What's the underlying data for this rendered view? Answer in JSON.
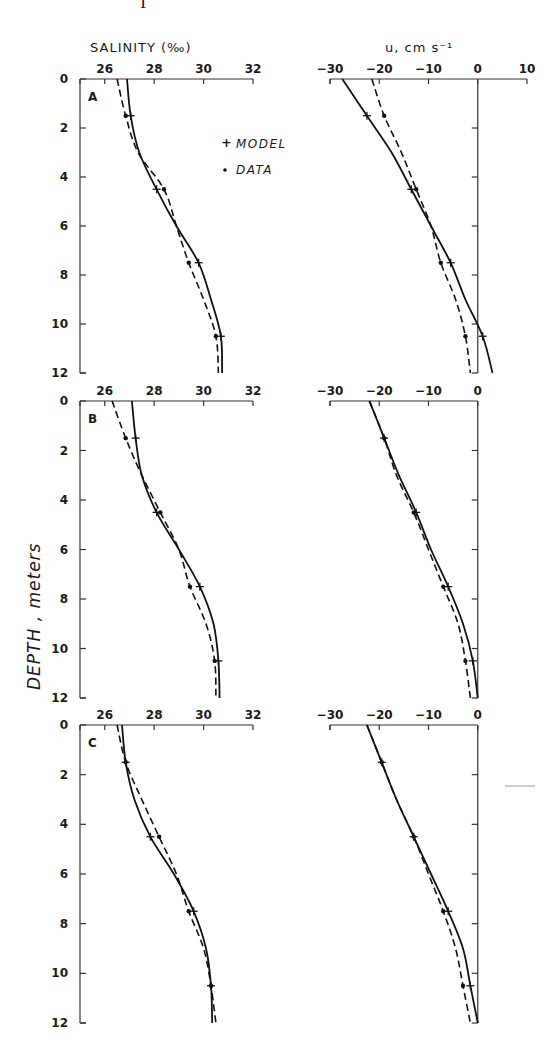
{
  "figure": {
    "top_fragment": "I",
    "y_axis_title": "DEPTH , meters",
    "left_column_title": "SALINITY (‰)",
    "right_column_title": "u, cm s⁻¹",
    "legend": {
      "model_label": "MODEL",
      "data_label": "DATA",
      "model_marker": "+",
      "data_marker": "•"
    }
  },
  "chart_data": [
    {
      "panel": "A",
      "type": "line",
      "title": "SALINITY (‰)",
      "xlabel": "SALINITY (‰)",
      "ylabel": "DEPTH , meters",
      "x_ticks": [
        26,
        28,
        30,
        32
      ],
      "y_ticks": [
        0,
        2,
        4,
        6,
        8,
        10,
        12
      ],
      "xlim": [
        25,
        32
      ],
      "ylim": [
        12,
        0
      ],
      "depth": [
        0,
        1.5,
        3,
        4.5,
        6,
        7.5,
        9,
        10.5,
        12
      ],
      "markers_at_depth": [
        1.5,
        4.5,
        7.5,
        10.5
      ],
      "series": [
        {
          "name": "MODEL",
          "style": "solid",
          "marker": "+",
          "values": [
            26.9,
            27.05,
            27.4,
            28.1,
            28.9,
            29.8,
            30.3,
            30.7,
            30.75
          ]
        },
        {
          "name": "DATA",
          "style": "dashed",
          "marker": "dot",
          "values": [
            26.5,
            26.85,
            27.35,
            28.4,
            28.9,
            29.4,
            30.0,
            30.5,
            30.6
          ]
        }
      ]
    },
    {
      "panel": "A",
      "type": "line",
      "title": "u, cm s⁻¹",
      "xlabel": "u, cm s⁻¹",
      "ylabel": "DEPTH , meters",
      "x_ticks": [
        -30,
        -20,
        -10,
        0,
        10
      ],
      "y_ticks": [
        0,
        2,
        4,
        6,
        8,
        10,
        12
      ],
      "xlim": [
        -30,
        10
      ],
      "ylim": [
        12,
        0
      ],
      "depth": [
        0,
        1.5,
        3,
        4.5,
        6,
        7.5,
        9,
        10.5,
        12
      ],
      "markers_at_depth": [
        1.5,
        4.5,
        7.5,
        10.5
      ],
      "series": [
        {
          "name": "MODEL",
          "style": "solid",
          "marker": "+",
          "values": [
            -27.5,
            -22.5,
            -17.5,
            -13.5,
            -9.5,
            -5.5,
            -2.5,
            1,
            3
          ]
        },
        {
          "name": "DATA",
          "style": "dashed",
          "marker": "dot",
          "values": [
            -21.5,
            -19,
            -15.5,
            -12.5,
            -9.5,
            -7.5,
            -4.5,
            -2.5,
            -1.5
          ]
        }
      ]
    },
    {
      "panel": "B",
      "type": "line",
      "title": "SALINITY (‰)",
      "xlabel": "SALINITY (‰)",
      "ylabel": "DEPTH , meters",
      "x_ticks": [
        26,
        28,
        30,
        32
      ],
      "y_ticks": [
        0,
        2,
        4,
        6,
        8,
        10,
        12
      ],
      "xlim": [
        25,
        32
      ],
      "ylim": [
        12,
        0
      ],
      "depth": [
        0,
        1.5,
        3,
        4.5,
        6,
        7.5,
        9,
        10.5,
        12
      ],
      "markers_at_depth": [
        1.5,
        4.5,
        7.5,
        10.5
      ],
      "series": [
        {
          "name": "MODEL",
          "style": "solid",
          "marker": "+",
          "values": [
            27.1,
            27.25,
            27.5,
            28.1,
            29.0,
            29.85,
            30.4,
            30.6,
            30.65
          ]
        },
        {
          "name": "DATA",
          "style": "dashed",
          "marker": "dot",
          "values": [
            26.3,
            26.85,
            27.5,
            28.25,
            29.0,
            29.45,
            30.1,
            30.45,
            30.5
          ]
        }
      ]
    },
    {
      "panel": "B",
      "type": "line",
      "title": "u, cm s⁻¹",
      "xlabel": "u, cm s⁻¹",
      "ylabel": "DEPTH , meters",
      "x_ticks": [
        -30,
        -20,
        -10,
        0
      ],
      "y_ticks": [
        0,
        2,
        4,
        6,
        8,
        10,
        12
      ],
      "xlim": [
        -30,
        0
      ],
      "ylim": [
        12,
        0
      ],
      "depth": [
        0,
        1.5,
        3,
        4.5,
        6,
        7.5,
        9,
        10.5,
        12
      ],
      "markers_at_depth": [
        1.5,
        4.5,
        7.5,
        10.5
      ],
      "series": [
        {
          "name": "MODEL",
          "style": "solid",
          "marker": "+",
          "values": [
            -22,
            -19,
            -16,
            -12.5,
            -9.5,
            -6,
            -3,
            -1,
            0
          ]
        },
        {
          "name": "DATA",
          "style": "dashed",
          "marker": "dot",
          "values": [
            -22,
            -19,
            -16.5,
            -13,
            -10,
            -7,
            -4,
            -2.5,
            -1.5
          ]
        }
      ]
    },
    {
      "panel": "C",
      "type": "line",
      "title": "SALINITY (‰)",
      "xlabel": "SALINITY (‰)",
      "ylabel": "DEPTH , meters",
      "x_ticks": [
        26,
        28,
        30,
        32
      ],
      "y_ticks": [
        0,
        2,
        4,
        6,
        8,
        10,
        12
      ],
      "xlim": [
        25,
        32
      ],
      "ylim": [
        12,
        0
      ],
      "depth": [
        0,
        1.5,
        3,
        4.5,
        6,
        7.5,
        9,
        10.5,
        12
      ],
      "markers_at_depth": [
        1.5,
        4.5,
        7.5,
        10.5
      ],
      "series": [
        {
          "name": "MODEL",
          "style": "solid",
          "marker": "+",
          "values": [
            26.7,
            26.85,
            27.2,
            27.85,
            28.8,
            29.6,
            30.1,
            30.3,
            30.35
          ]
        },
        {
          "name": "DATA",
          "style": "dashed",
          "marker": "dot",
          "values": [
            26.5,
            26.85,
            27.5,
            28.2,
            28.9,
            29.4,
            30.0,
            30.3,
            30.5
          ]
        }
      ]
    },
    {
      "panel": "C",
      "type": "line",
      "title": "u, cm s⁻¹",
      "xlabel": "u, cm s⁻¹",
      "ylabel": "DEPTH , meters",
      "x_ticks": [
        -30,
        -20,
        -10,
        0
      ],
      "y_ticks": [
        0,
        2,
        4,
        6,
        8,
        10,
        12
      ],
      "xlim": [
        -30,
        0
      ],
      "ylim": [
        12,
        0
      ],
      "depth": [
        0,
        1.5,
        3,
        4.5,
        6,
        7.5,
        9,
        10.5,
        12
      ],
      "markers_at_depth": [
        1.5,
        4.5,
        7.5,
        10.5
      ],
      "series": [
        {
          "name": "MODEL",
          "style": "solid",
          "marker": "+",
          "values": [
            -22.5,
            -19.5,
            -16.5,
            -13,
            -9.5,
            -6,
            -3,
            -1.5,
            0
          ]
        },
        {
          "name": "DATA",
          "style": "dashed",
          "marker": "dot",
          "values": [
            -22.5,
            -19.5,
            -16.5,
            -13,
            -10,
            -7,
            -4.5,
            -3,
            -1.5
          ]
        }
      ]
    }
  ]
}
